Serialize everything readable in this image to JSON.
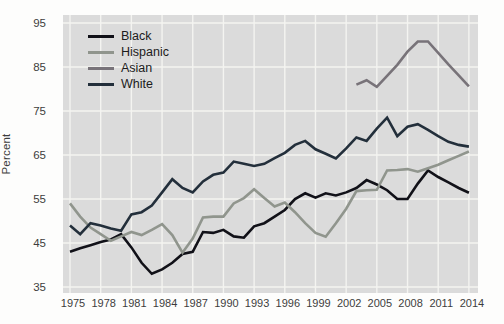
{
  "figure_name": "college-enrollment-by-race-line-chart",
  "colors": {
    "plot_background": "#dbdbdb",
    "gridline": "#f4f4f1",
    "page_background": "#fdfdfc",
    "tick_text": "#3d3d3d"
  },
  "chart_data": {
    "type": "line",
    "title": "",
    "xlabel": "",
    "ylabel": "Percent",
    "ylim": [
      35,
      95
    ],
    "yticks": [
      95,
      85,
      75,
      65,
      55,
      45,
      35
    ],
    "xticks": [
      1975,
      1978,
      1981,
      1984,
      1987,
      1990,
      1993,
      1996,
      1999,
      2002,
      2005,
      2008,
      2011,
      2014
    ],
    "x_range": [
      1975,
      2014
    ],
    "grid": true,
    "legend_position": "top-left",
    "series": [
      {
        "name": "Black",
        "color": "#111118",
        "start_year": 1975,
        "values": [
          43,
          43.8,
          44.5,
          45.2,
          45.8,
          47,
          44,
          40.5,
          38,
          39,
          40.5,
          42.5,
          43,
          47.5,
          47.3,
          48,
          46.5,
          46.2,
          48.8,
          49.5,
          51,
          52.5,
          55,
          56.3,
          55.3,
          56.3,
          55.8,
          56.5,
          57.5,
          59.3,
          58.3,
          57,
          55,
          55,
          58.5,
          61.5,
          60,
          58.8,
          57.5,
          56.4
        ]
      },
      {
        "name": "Hispanic",
        "color": "#90958d",
        "start_year": 1975,
        "values": [
          54,
          51,
          48.5,
          47,
          45.5,
          46.5,
          47.5,
          46.8,
          48,
          49.3,
          46.8,
          42.8,
          46,
          50.8,
          51,
          51,
          54,
          55.2,
          57.2,
          55.2,
          53.3,
          54.2,
          52,
          49.5,
          47.3,
          46.4,
          49.5,
          52.8,
          56.8,
          57,
          57.1,
          61.5,
          61.6,
          61.8,
          61.2,
          62,
          62.8,
          63.8,
          64.8,
          65.8
        ]
      },
      {
        "name": "Asian",
        "color": "#787379",
        "start_year": 2003,
        "values": [
          81,
          82,
          80.5,
          83,
          85.5,
          88.5,
          90.8,
          90.8,
          88.2,
          85.6,
          83.1,
          80.6
        ]
      },
      {
        "name": "White",
        "color": "#232f3b",
        "start_year": 1975,
        "values": [
          49,
          47,
          49.5,
          49,
          48.3,
          47.8,
          51.5,
          52,
          53.5,
          56.5,
          59.5,
          57.5,
          56.5,
          59,
          60.5,
          61,
          63.5,
          63,
          62.5,
          63,
          64.3,
          65.5,
          67.3,
          68.2,
          66.3,
          65.3,
          64.2,
          66.5,
          69,
          68.2,
          71,
          73.5,
          69.3,
          71.4,
          72,
          70.7,
          69.3,
          68,
          67.3,
          66.9
        ]
      }
    ]
  },
  "legend": {
    "items": [
      "Black",
      "Hispanic",
      "Asian",
      "White"
    ]
  }
}
